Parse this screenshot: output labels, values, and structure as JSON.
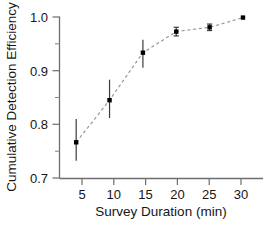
{
  "chart_data": {
    "type": "line",
    "title": "",
    "xlabel": "Survey Duration (min)",
    "ylabel": "Cumulative Detection Efficiency",
    "x": [
      5,
      10,
      15,
      20,
      25,
      30
    ],
    "values": [
      0.767,
      0.845,
      0.933,
      0.972,
      0.98,
      0.998
    ],
    "yerr_upper": [
      0.81,
      0.883,
      0.957,
      0.98,
      0.986,
      0.998
    ],
    "yerr_lower": [
      0.733,
      0.812,
      0.905,
      0.964,
      0.974,
      0.998
    ],
    "xlim": [
      2.5,
      33
    ],
    "ylim": [
      0.7,
      1.0
    ],
    "xticks": [
      5,
      10,
      15,
      20,
      25,
      30
    ],
    "xtick_labels": [
      "5",
      "10",
      "15",
      "20",
      "25",
      "30"
    ],
    "yticks": [
      0.7,
      0.8,
      0.9,
      1.0
    ],
    "ytick_labels": [
      "0.7",
      "0.8",
      "0.9",
      "1.0"
    ],
    "yticks_minor": [
      0.75,
      0.85,
      0.95
    ],
    "grid": false,
    "legend": null,
    "marker": "square",
    "linestyle": "dashed",
    "line_color": "#9a9a9a",
    "marker_color": "#000000",
    "errorbar_color": "#3a3a3a",
    "axis_color": "#6d6d6d",
    "background_color": "#ffffff"
  }
}
